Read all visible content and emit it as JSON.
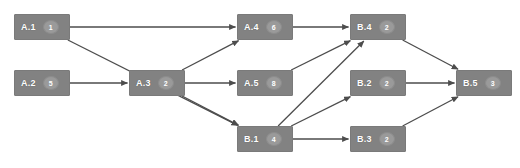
{
  "diagram": {
    "colors": {
      "background": "#ffffff",
      "node_fill": "#828282",
      "node_border": "#7a7a7a",
      "node_text": "#ffffff",
      "badge_fill": "#9a9a9a",
      "badge_border": "#8d8d8d",
      "badge_text": "#ffffff",
      "edge": "#4d4d4d"
    },
    "nodes": [
      {
        "id": "A1",
        "label": "A.1",
        "badge": "1",
        "x": 14,
        "y": 14,
        "w": 56,
        "h": 26
      },
      {
        "id": "A2",
        "label": "A.2",
        "badge": "5",
        "x": 14,
        "y": 70,
        "w": 56,
        "h": 26
      },
      {
        "id": "A3",
        "label": "A.3",
        "badge": "2",
        "x": 129,
        "y": 70,
        "w": 56,
        "h": 26
      },
      {
        "id": "A4",
        "label": "A.4",
        "badge": "6",
        "x": 237,
        "y": 14,
        "w": 56,
        "h": 26
      },
      {
        "id": "A5",
        "label": "A.5",
        "badge": "8",
        "x": 237,
        "y": 70,
        "w": 56,
        "h": 26
      },
      {
        "id": "B1",
        "label": "B.1",
        "badge": "4",
        "x": 237,
        "y": 126,
        "w": 56,
        "h": 26
      },
      {
        "id": "B4",
        "label": "B.4",
        "badge": "2",
        "x": 350,
        "y": 14,
        "w": 56,
        "h": 26
      },
      {
        "id": "B2",
        "label": "B.2",
        "badge": "2",
        "x": 350,
        "y": 70,
        "w": 56,
        "h": 26
      },
      {
        "id": "B3",
        "label": "B.3",
        "badge": "2",
        "x": 350,
        "y": 126,
        "w": 56,
        "h": 26
      },
      {
        "id": "B5",
        "label": "B.5",
        "badge": "3",
        "x": 456,
        "y": 70,
        "w": 56,
        "h": 26
      }
    ],
    "edges": [
      {
        "from": "A1",
        "to": "A4"
      },
      {
        "from": "A1",
        "to": "B1"
      },
      {
        "from": "A2",
        "to": "A3"
      },
      {
        "from": "A3",
        "to": "A4"
      },
      {
        "from": "A3",
        "to": "A5"
      },
      {
        "from": "A3",
        "to": "B1"
      },
      {
        "from": "A4",
        "to": "B4"
      },
      {
        "from": "A5",
        "to": "B4"
      },
      {
        "from": "B1",
        "to": "B4"
      },
      {
        "from": "B1",
        "to": "B2"
      },
      {
        "from": "B1",
        "to": "B3"
      },
      {
        "from": "B4",
        "to": "B5"
      },
      {
        "from": "B2",
        "to": "B5"
      },
      {
        "from": "B3",
        "to": "B5"
      }
    ]
  }
}
